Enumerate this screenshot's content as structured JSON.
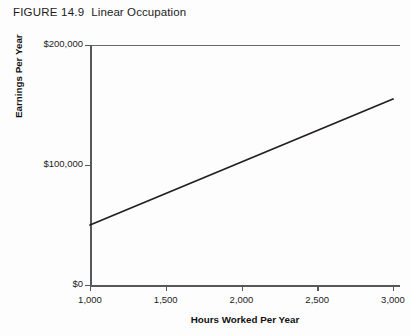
{
  "figure": {
    "number": "FIGURE 14.9",
    "name": "Linear Occupation"
  },
  "chart_data": {
    "type": "line",
    "xlabel": "Hours Worked Per Year",
    "ylabel": "Earnings Per Year",
    "x_tick_labels": [
      "1,000",
      "1,500",
      "2,000",
      "2,500",
      "3,000"
    ],
    "x_tick_values": [
      1000,
      1500,
      2000,
      2500,
      3000
    ],
    "y_tick_labels": [
      "$0",
      "$100,000",
      "$200,000"
    ],
    "y_tick_values": [
      0,
      100000,
      200000
    ],
    "xlim": [
      1000,
      3000
    ],
    "ylim": [
      0,
      200000
    ],
    "grid": false,
    "legend": "none",
    "series": [
      {
        "name": "Linear occupation earnings",
        "x": [
          1000,
          3000
        ],
        "values": [
          50000,
          155000
        ],
        "color": "#231f20",
        "line_width": 1.8
      }
    ]
  },
  "style": {
    "axis_color": "#58585a",
    "line_color": "#231f20",
    "text_color": "#1c1c1c",
    "background": "#fdfdfd"
  }
}
